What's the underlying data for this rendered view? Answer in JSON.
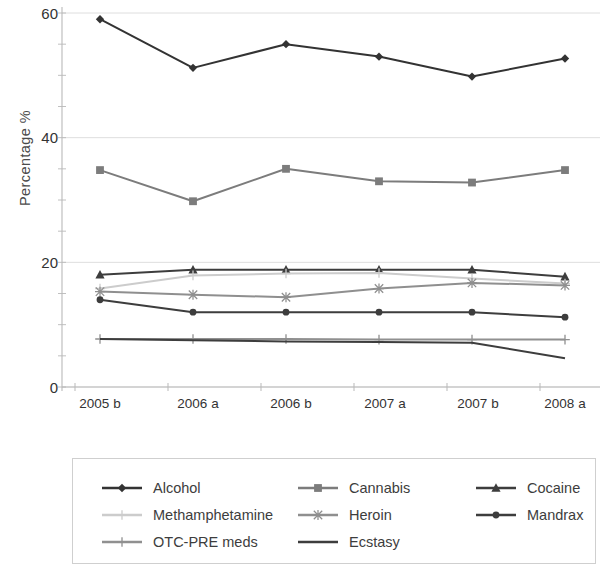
{
  "chart_data": {
    "type": "line",
    "title": "",
    "xlabel": "",
    "ylabel": "Percentage  %",
    "categories": [
      "2005 b",
      "2006 a",
      "2006 b",
      "2007 a",
      "2007 b",
      "2008 a"
    ],
    "ylim": [
      0,
      60
    ],
    "yticks": [
      0,
      20,
      40,
      60
    ],
    "grid": true,
    "legend_position": "bottom",
    "series": [
      {
        "name": "Alcohol",
        "marker": "diamond",
        "color": "#333333",
        "values": [
          59.0,
          51.2,
          55.0,
          53.0,
          49.8,
          52.7
        ]
      },
      {
        "name": "Cannabis",
        "marker": "square",
        "color": "#7c7c7c",
        "values": [
          34.8,
          29.8,
          35.0,
          33.0,
          32.8,
          34.8
        ]
      },
      {
        "name": "Cocaine",
        "marker": "triangle",
        "color": "#3d3d3d",
        "values": [
          18.0,
          18.8,
          18.8,
          18.8,
          18.8,
          17.7
        ]
      },
      {
        "name": "Methamphetamine",
        "marker": "plus",
        "color": "#cccccc",
        "values": [
          15.8,
          17.9,
          18.2,
          18.3,
          17.4,
          16.6
        ]
      },
      {
        "name": "Heroin",
        "marker": "star",
        "color": "#8f8f8f",
        "values": [
          15.3,
          14.8,
          14.4,
          15.8,
          16.7,
          16.3
        ]
      },
      {
        "name": "Mandrax",
        "marker": "circle",
        "color": "#3d3d3d",
        "values": [
          14.0,
          12.0,
          12.0,
          12.0,
          12.0,
          11.2
        ]
      },
      {
        "name": "OTC-PRE meds",
        "marker": "plus",
        "color": "#909090",
        "values": [
          7.7,
          7.7,
          7.7,
          7.6,
          7.6,
          7.6
        ]
      },
      {
        "name": "Ecstasy",
        "marker": "none",
        "color": "#3d3d3d",
        "values": [
          7.7,
          7.5,
          7.3,
          7.2,
          7.1,
          4.6
        ]
      }
    ]
  },
  "axes": {
    "ylabel": "Percentage  %",
    "ytick_labels": [
      "60",
      "40",
      "20",
      "0"
    ],
    "xtick_labels": [
      "2005 b",
      "2006 a",
      "2006 b",
      "2007 a",
      "2007 b",
      "2008 a"
    ]
  },
  "legend": {
    "entries": [
      {
        "label": "Alcohol"
      },
      {
        "label": "Cannabis"
      },
      {
        "label": "Cocaine"
      },
      {
        "label": "Methamphetamine"
      },
      {
        "label": "Heroin"
      },
      {
        "label": "Mandrax"
      },
      {
        "label": "OTC-PRE meds"
      },
      {
        "label": "Ecstasy"
      }
    ]
  },
  "colors": {
    "grid": "#dedede",
    "axis": "#b9b9b9",
    "text": "#333333",
    "legend_border": "#cfcfcf"
  }
}
